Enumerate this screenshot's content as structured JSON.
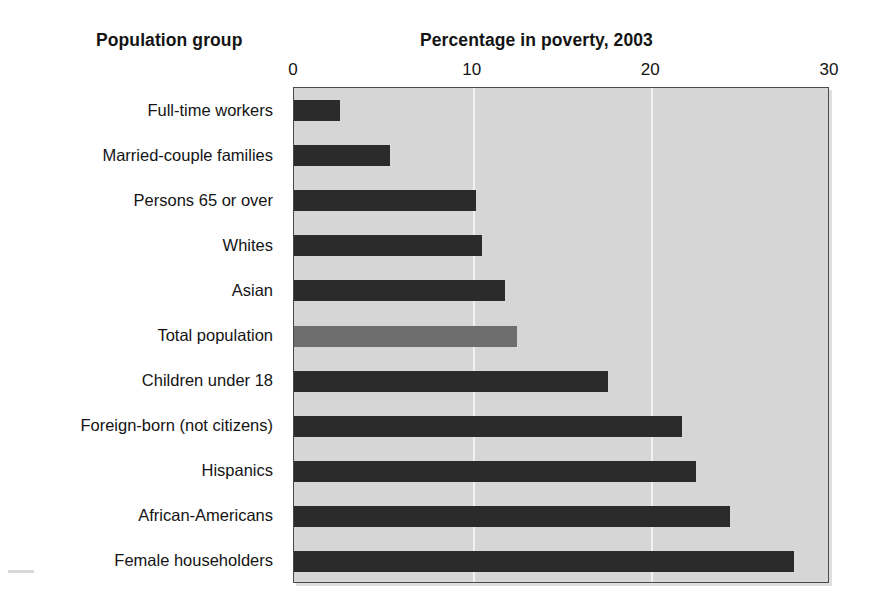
{
  "headers": {
    "groups": "Population group",
    "values": "Percentage in poverty, 2003"
  },
  "colors": {
    "bar": "#2b2b2b",
    "bar_highlight": "#6e6e6e",
    "plot_background": "#d6d6d6",
    "gridline": "#f2f2f2",
    "plot_border": "#4a4a4a"
  },
  "chart_data": {
    "type": "bar",
    "orientation": "horizontal",
    "title": "Percentage in poverty, 2003",
    "xlabel": "Percentage in poverty, 2003",
    "ylabel": "Population group",
    "xlim": [
      0,
      30
    ],
    "xticks": [
      0,
      10,
      20,
      30
    ],
    "xtick_labels": [
      "0",
      "10",
      "20",
      "30"
    ],
    "grid": true,
    "legend": false,
    "highlight_category": "Total population",
    "categories": [
      "Full-time workers",
      "Married-couple families",
      "Persons 65 or over",
      "Whites",
      "Asian",
      "Total population",
      "Children under 18",
      "Foreign-born (not citizens)",
      "Hispanics",
      "African-Americans",
      "Female householders"
    ],
    "values": [
      2.6,
      5.4,
      10.2,
      10.5,
      11.8,
      12.5,
      17.6,
      21.7,
      22.5,
      24.4,
      28.0
    ]
  }
}
